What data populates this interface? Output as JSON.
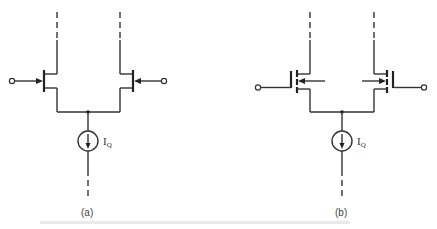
{
  "figure": {
    "panels": [
      {
        "id": "a",
        "caption": "(a)",
        "transistor_type": "JFET",
        "current_source_label": "I",
        "current_source_subscript": "Q"
      },
      {
        "id": "b",
        "caption": "(b)",
        "transistor_type": "MOSFET",
        "current_source_label": "I",
        "current_source_subscript": "Q"
      }
    ],
    "bottom_caption": ""
  },
  "colors": {
    "line": "#333333",
    "background": "#ffffff"
  }
}
